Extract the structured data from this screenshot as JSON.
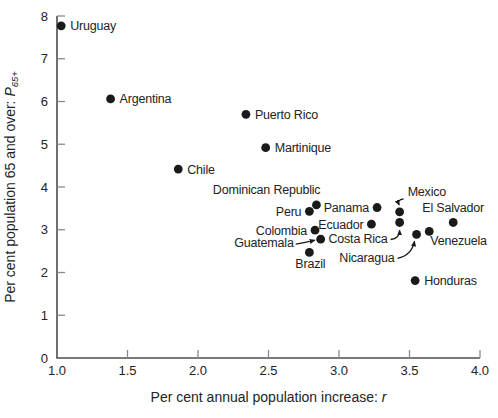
{
  "chart_data": {
    "type": "scatter",
    "title": "",
    "xlabel": {
      "prefix": "Per cent annual population increase: ",
      "var": "r"
    },
    "ylabel": {
      "prefix": "Per cent population 65 and over: ",
      "var": "P",
      "sub": "65+"
    },
    "xlim": [
      1.0,
      4.0
    ],
    "ylim": [
      0,
      8
    ],
    "x_ticks": [
      "1.0",
      "1.5",
      "2.0",
      "2.5",
      "3.0",
      "3.5",
      "4.0"
    ],
    "y_ticks": [
      "0",
      "1",
      "2",
      "3",
      "4",
      "5",
      "6",
      "7",
      "8"
    ],
    "grid": false,
    "legend": "none",
    "colors": {
      "point": "#1a1a1a",
      "axis": "#4d4d4d",
      "tick": "#8a8a8a",
      "text": "#232323"
    },
    "points": [
      {
        "name": "Uruguay",
        "x": 1.03,
        "y": 7.77,
        "label": {
          "anchor": "start",
          "dx": 9,
          "dy": 4.5
        }
      },
      {
        "name": "Argentina",
        "x": 1.38,
        "y": 6.06,
        "label": {
          "anchor": "start",
          "dx": 9,
          "dy": 4.5
        }
      },
      {
        "name": "Chile",
        "x": 1.86,
        "y": 4.42,
        "label": {
          "anchor": "start",
          "dx": 9,
          "dy": 4.5
        }
      },
      {
        "name": "Puerto Rico",
        "x": 2.34,
        "y": 5.7,
        "label": {
          "anchor": "start",
          "dx": 9,
          "dy": 4.5
        }
      },
      {
        "name": "Martinique",
        "x": 2.48,
        "y": 4.92,
        "label": {
          "anchor": "start",
          "dx": 9,
          "dy": 4.5
        }
      },
      {
        "name": "Dominican Republic",
        "x": 2.84,
        "y": 3.58,
        "label": {
          "anchor": "end",
          "dx": 4,
          "dy": -11
        }
      },
      {
        "name": "Peru",
        "x": 2.79,
        "y": 3.43,
        "label": {
          "anchor": "end",
          "dx": -8,
          "dy": 4.5
        }
      },
      {
        "name": "Panama",
        "x": 3.27,
        "y": 3.52,
        "label": {
          "anchor": "end",
          "dx": -8,
          "dy": 4.5
        }
      },
      {
        "name": "Mexico",
        "x": 3.43,
        "y": 3.42,
        "label": {
          "anchor": "start",
          "dx": 8,
          "dy": -16
        },
        "arrow": {
          "s": [
            4,
            -13
          ],
          "c": [
            -3,
            -12
          ],
          "e": [
            -0.5,
            -7
          ]
        }
      },
      {
        "name": "Costa Rica",
        "x": 3.43,
        "y": 3.17,
        "label": {
          "anchor": "end",
          "dx": -12,
          "dy": 21
        },
        "arrow": {
          "s": [
            -9,
            17
          ],
          "c": [
            0,
            16
          ],
          "e": [
            0,
            8
          ]
        }
      },
      {
        "name": "Ecuador",
        "x": 3.23,
        "y": 3.13,
        "label": {
          "anchor": "end",
          "dx": -8,
          "dy": 4.5
        }
      },
      {
        "name": "El Salvador",
        "x": 3.81,
        "y": 3.17,
        "label": {
          "anchor": "middle",
          "dx": 0,
          "dy": -10
        }
      },
      {
        "name": "Colombia",
        "x": 2.83,
        "y": 2.99,
        "label": {
          "anchor": "end",
          "dx": -8,
          "dy": 4.5
        }
      },
      {
        "name": "Guatemala",
        "x": 2.87,
        "y": 2.78,
        "label": {
          "anchor": "end",
          "dx": -27,
          "dy": 8
        },
        "arrow": {
          "s": [
            -25,
            5
          ],
          "c": [
            -13,
            3
          ],
          "e": [
            -6,
            1
          ]
        }
      },
      {
        "name": "Venezuela",
        "x": 3.64,
        "y": 2.96,
        "label": {
          "anchor": "start",
          "dx": 1,
          "dy": 14
        }
      },
      {
        "name": "Nicaragua",
        "x": 3.55,
        "y": 2.89,
        "label": {
          "anchor": "end",
          "dx": -22,
          "dy": 28
        },
        "arrow": {
          "s": [
            -19,
            24
          ],
          "c": [
            -5,
            21
          ],
          "e": [
            -2,
            7
          ]
        }
      },
      {
        "name": "Brazil",
        "x": 2.79,
        "y": 2.47,
        "label": {
          "anchor": "middle",
          "dx": 1,
          "dy": 16
        }
      },
      {
        "name": "Honduras",
        "x": 3.54,
        "y": 1.81,
        "label": {
          "anchor": "start",
          "dx": 9,
          "dy": 4.5
        }
      }
    ]
  }
}
